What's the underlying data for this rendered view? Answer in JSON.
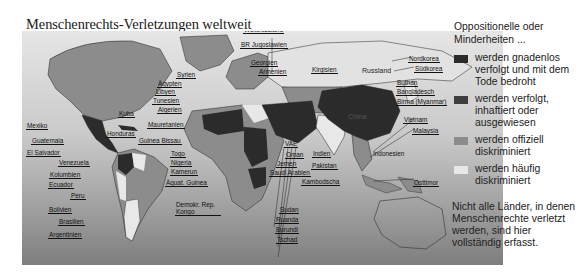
{
  "title": "Menschenrechts-Verletzungen weltweit",
  "legend": {
    "heading": "Oppositionelle oder Minderheiten ...",
    "items": [
      {
        "label": "werden gnadenlos verfolgt und mit dem Tode bedroht",
        "color": "#2b2b2b"
      },
      {
        "label": "werden verfolgt, inhaftiert oder ausgewiesen",
        "color": "#3e3e3e"
      },
      {
        "label": "werden offiziell diskriminiert",
        "color": "#8c8c8c"
      },
      {
        "label": "werden häufig diskriminiert",
        "color": "#e8e8e8"
      }
    ]
  },
  "note": "Nicht alle Länder, in denen Menschenrechte verletzt werden, sind hier vollständig erfasst.",
  "region_labels": {
    "on_map": [
      "Russland",
      "China"
    ]
  },
  "country_labels": [
    {
      "name": "BR Jugoslawien",
      "x": 240,
      "y": 41
    },
    {
      "name": "Weißrussland",
      "x": 243,
      "y": 26
    },
    {
      "name": "Georgien",
      "x": 250,
      "y": 59
    },
    {
      "name": "Armenien",
      "x": 258,
      "y": 68
    },
    {
      "name": "Kirgisien",
      "x": 311,
      "y": 66
    },
    {
      "name": "Syrien",
      "x": 176,
      "y": 71
    },
    {
      "name": "Ägypten",
      "x": 157,
      "y": 80
    },
    {
      "name": "Libyen",
      "x": 155,
      "y": 88
    },
    {
      "name": "Tunesien",
      "x": 152,
      "y": 97
    },
    {
      "name": "Algerien",
      "x": 157,
      "y": 106
    },
    {
      "name": "Kuba",
      "x": 118,
      "y": 110
    },
    {
      "name": "Mauretanien",
      "x": 147,
      "y": 121
    },
    {
      "name": "Mexiko",
      "x": 26,
      "y": 122
    },
    {
      "name": "Honduras",
      "x": 106,
      "y": 130
    },
    {
      "name": "Guinea Bissau",
      "x": 138,
      "y": 137
    },
    {
      "name": "Guatemala",
      "x": 31,
      "y": 137
    },
    {
      "name": "El Salvador",
      "x": 26,
      "y": 149
    },
    {
      "name": "Togo",
      "x": 170,
      "y": 150
    },
    {
      "name": "Venezuela",
      "x": 58,
      "y": 159
    },
    {
      "name": "Nigeria",
      "x": 170,
      "y": 159
    },
    {
      "name": "Kamerun",
      "x": 170,
      "y": 168
    },
    {
      "name": "Kolumbien",
      "x": 49,
      "y": 171
    },
    {
      "name": "Äquat. Guinea",
      "x": 165,
      "y": 179
    },
    {
      "name": "Ecuador",
      "x": 48,
      "y": 181
    },
    {
      "name": "Peru",
      "x": 70,
      "y": 192
    },
    {
      "name": "Demokr. Rep. Kongo",
      "x": 175,
      "y": 201
    },
    {
      "name": "Bolivien",
      "x": 48,
      "y": 206
    },
    {
      "name": "Brasilien",
      "x": 58,
      "y": 218
    },
    {
      "name": "Argentinien",
      "x": 48,
      "y": 231
    },
    {
      "name": "VAE",
      "x": 284,
      "y": 140
    },
    {
      "name": "Oman",
      "x": 285,
      "y": 151
    },
    {
      "name": "Indien",
      "x": 312,
      "y": 150
    },
    {
      "name": "Jemen",
      "x": 276,
      "y": 160
    },
    {
      "name": "Pakistan",
      "x": 311,
      "y": 162
    },
    {
      "name": "Saudi Arabien",
      "x": 269,
      "y": 169
    },
    {
      "name": "Kambodscha",
      "x": 301,
      "y": 178
    },
    {
      "name": "Sudan",
      "x": 279,
      "y": 206
    },
    {
      "name": "Ruanda",
      "x": 275,
      "y": 216
    },
    {
      "name": "Burundi",
      "x": 275,
      "y": 226
    },
    {
      "name": "Tschad",
      "x": 276,
      "y": 236
    },
    {
      "name": "Nordkorea",
      "x": 408,
      "y": 55
    },
    {
      "name": "Südkorea",
      "x": 414,
      "y": 65
    },
    {
      "name": "Buthan",
      "x": 396,
      "y": 79
    },
    {
      "name": "Bangladesch",
      "x": 396,
      "y": 88
    },
    {
      "name": "Birma (Myanmar)",
      "x": 396,
      "y": 98
    },
    {
      "name": "Vietnam",
      "x": 403,
      "y": 116
    },
    {
      "name": "Malaysia",
      "x": 412,
      "y": 127
    },
    {
      "name": "Indonesien",
      "x": 372,
      "y": 150
    },
    {
      "name": "Osttimor",
      "x": 413,
      "y": 179
    }
  ]
}
